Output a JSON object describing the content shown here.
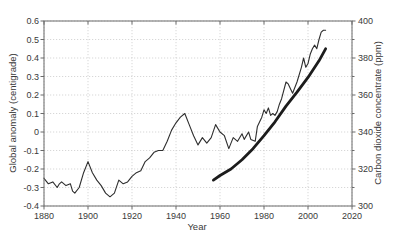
{
  "chart_data": {
    "type": "line",
    "title": "",
    "xlabel": "Year",
    "ylabel_left": "Global anomaly (centigrade)",
    "ylabel_right": "Carbon dioxide concentrate (ppm)",
    "x_range": [
      1880,
      2020
    ],
    "y_left_range": [
      -0.4,
      0.6
    ],
    "y_right_range": [
      300,
      400
    ],
    "x_ticks": [
      "1880",
      "1900",
      "1920",
      "1940",
      "1960",
      "1980",
      "2000",
      "2020"
    ],
    "y_left_ticks": [
      "0.6",
      "0.5",
      "0.4",
      "0.3",
      "0.2",
      "0.1",
      "0",
      "-0.1",
      "-0.2",
      "-0.3",
      "-0.4"
    ],
    "y_right_ticks": [
      "400",
      "380",
      "360",
      "340",
      "320",
      "300"
    ],
    "y_right_minor_ticks": [
      390,
      370,
      350,
      330,
      310
    ],
    "grid": true,
    "legend": "none",
    "colors": {
      "grid": "#cdcdcd",
      "axis": "#6b6b6b",
      "tick_text": "#3a3a3a",
      "background": "#ffffff",
      "temperature_line": "#2e2e2e",
      "co2_line": "#1c1c1c"
    },
    "series": [
      {
        "name": "global-temperature-anomaly",
        "axis": "left",
        "line_width": 1.1,
        "points": [
          [
            1880,
            -0.25
          ],
          [
            1882,
            -0.28
          ],
          [
            1884,
            -0.27
          ],
          [
            1886,
            -0.3
          ],
          [
            1887,
            -0.28
          ],
          [
            1888,
            -0.27
          ],
          [
            1890,
            -0.29
          ],
          [
            1892,
            -0.28
          ],
          [
            1893,
            -0.32
          ],
          [
            1894,
            -0.33
          ],
          [
            1896,
            -0.3
          ],
          [
            1898,
            -0.22
          ],
          [
            1900,
            -0.16
          ],
          [
            1902,
            -0.22
          ],
          [
            1904,
            -0.26
          ],
          [
            1906,
            -0.29
          ],
          [
            1908,
            -0.33
          ],
          [
            1910,
            -0.35
          ],
          [
            1912,
            -0.33
          ],
          [
            1914,
            -0.26
          ],
          [
            1916,
            -0.28
          ],
          [
            1918,
            -0.27
          ],
          [
            1920,
            -0.24
          ],
          [
            1922,
            -0.22
          ],
          [
            1924,
            -0.21
          ],
          [
            1926,
            -0.16
          ],
          [
            1928,
            -0.14
          ],
          [
            1930,
            -0.11
          ],
          [
            1932,
            -0.1
          ],
          [
            1934,
            -0.1
          ],
          [
            1936,
            -0.05
          ],
          [
            1938,
            0.01
          ],
          [
            1940,
            0.05
          ],
          [
            1942,
            0.08
          ],
          [
            1944,
            0.1
          ],
          [
            1946,
            0.04
          ],
          [
            1948,
            -0.02
          ],
          [
            1950,
            -0.07
          ],
          [
            1952,
            -0.03
          ],
          [
            1954,
            -0.06
          ],
          [
            1956,
            -0.03
          ],
          [
            1958,
            0.04
          ],
          [
            1960,
            0.0
          ],
          [
            1962,
            -0.02
          ],
          [
            1964,
            -0.09
          ],
          [
            1966,
            -0.03
          ],
          [
            1968,
            -0.05
          ],
          [
            1970,
            -0.01
          ],
          [
            1971,
            -0.04
          ],
          [
            1973,
            0.0
          ],
          [
            1974,
            -0.04
          ],
          [
            1976,
            -0.05
          ],
          [
            1977,
            0.03
          ],
          [
            1979,
            0.08
          ],
          [
            1980,
            0.12
          ],
          [
            1981,
            0.1
          ],
          [
            1982,
            0.13
          ],
          [
            1983,
            0.09
          ],
          [
            1984,
            0.1
          ],
          [
            1985,
            0.09
          ],
          [
            1986,
            0.11
          ],
          [
            1987,
            0.15
          ],
          [
            1988,
            0.18
          ],
          [
            1990,
            0.27
          ],
          [
            1991,
            0.26
          ],
          [
            1993,
            0.21
          ],
          [
            1995,
            0.27
          ],
          [
            1997,
            0.35
          ],
          [
            1998,
            0.4
          ],
          [
            1999,
            0.35
          ],
          [
            2000,
            0.37
          ],
          [
            2001,
            0.42
          ],
          [
            2002,
            0.45
          ],
          [
            2003,
            0.47
          ],
          [
            2004,
            0.45
          ],
          [
            2005,
            0.5
          ],
          [
            2006,
            0.54
          ],
          [
            2007,
            0.55
          ],
          [
            2008,
            0.55
          ]
        ]
      },
      {
        "name": "carbon-dioxide-concentration",
        "axis": "right",
        "line_width": 2.8,
        "points": [
          [
            1957,
            314
          ],
          [
            1960,
            316.5
          ],
          [
            1965,
            320
          ],
          [
            1970,
            325
          ],
          [
            1975,
            331
          ],
          [
            1980,
            338
          ],
          [
            1985,
            345.5
          ],
          [
            1990,
            354
          ],
          [
            1995,
            361.5
          ],
          [
            2000,
            369.5
          ],
          [
            2005,
            378.5
          ],
          [
            2008,
            385
          ]
        ]
      }
    ]
  }
}
